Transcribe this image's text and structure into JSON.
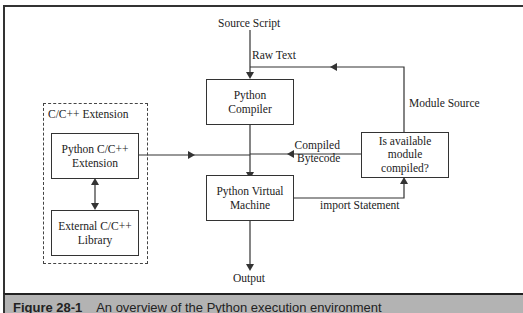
{
  "diagram": {
    "nodes": {
      "source_script": "Source Script",
      "python_compiler": [
        "Python",
        "Compiler"
      ],
      "python_vm": [
        "Python Virtual",
        "Machine"
      ],
      "decision": [
        "Is available",
        "module",
        "compiled?"
      ],
      "output": "Output",
      "extension_group": "C/C++ Extension",
      "python_ext": [
        "Python C/C++",
        "Extension"
      ],
      "external_lib": [
        "External C/C++",
        "Library"
      ]
    },
    "edges": {
      "raw_text": "Raw Text",
      "module_source": "Module Source",
      "compiled_bytecode": [
        "Compiled",
        "Bytecode"
      ],
      "import_statement": "import Statement"
    },
    "colors": {
      "line": "#333333",
      "caption_bg": "#b3b3b3",
      "background": "#ffffff"
    }
  },
  "caption": {
    "figure_label": "Figure 28-1",
    "text": "An overview of the Python execution environment"
  }
}
